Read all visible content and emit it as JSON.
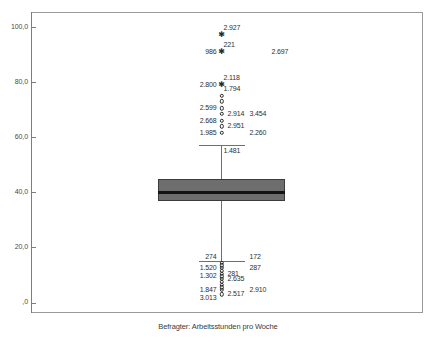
{
  "chart_data": {
    "type": "box",
    "title": "",
    "xlabel": "Befragter: Arbeitsstunden pro Woche",
    "ylabel": "",
    "ylim": [
      0,
      105
    ],
    "grid": false,
    "legend": "none",
    "categories": [
      "Befragter: Arbeitsstunden pro Woche"
    ],
    "y_ticks": [
      {
        "value": 100,
        "label": "100,0"
      },
      {
        "value": 80,
        "label": "80,0"
      },
      {
        "value": 60,
        "label": "60,0"
      },
      {
        "value": 40,
        "label": "40,0"
      },
      {
        "value": 20,
        "label": "20,0"
      },
      {
        "value": 0,
        "label": ",0"
      }
    ],
    "box": {
      "q1": 37.0,
      "median": 40.0,
      "q3": 45.0,
      "whisker_low": 15.0,
      "whisker_high": 57.0
    },
    "outliers": [
      {
        "value": 97.0,
        "marker": "star",
        "labels": [
          {
            "text": "2.927",
            "side": "above"
          }
        ]
      },
      {
        "value": 91.0,
        "marker": "star",
        "labels": [
          {
            "text": "986",
            "side": "left"
          },
          {
            "text": "221",
            "side": "above"
          },
          {
            "text": "2.697",
            "side": "right"
          }
        ]
      },
      {
        "value": 79.0,
        "marker": "star",
        "labels": [
          {
            "text": "2.800",
            "side": "left"
          },
          {
            "text": "2.118",
            "side": "above"
          }
        ]
      },
      {
        "value": 75.0,
        "marker": "circle",
        "labels": [
          {
            "text": "1.794",
            "side": "above"
          }
        ]
      },
      {
        "value": 73.0,
        "marker": "circle",
        "labels": []
      },
      {
        "value": 70.5,
        "marker": "circle",
        "labels": [
          {
            "text": "2.599",
            "side": "left"
          }
        ]
      },
      {
        "value": 68.5,
        "marker": "circle",
        "labels": [
          {
            "text": "2.914",
            "side": "right"
          },
          {
            "text": "3.454",
            "side": "right"
          }
        ]
      },
      {
        "value": 66.0,
        "marker": "circle",
        "labels": [
          {
            "text": "2.668",
            "side": "left"
          }
        ]
      },
      {
        "value": 64.0,
        "marker": "circle",
        "labels": [
          {
            "text": "2.951",
            "side": "right"
          }
        ]
      },
      {
        "value": 61.5,
        "marker": "circle",
        "labels": [
          {
            "text": "1.985",
            "side": "left"
          },
          {
            "text": "2.260",
            "side": "right"
          }
        ]
      },
      {
        "value": 57.0,
        "marker": "none",
        "labels": [
          {
            "text": "1.481",
            "side": "below"
          }
        ]
      },
      {
        "value": 16.5,
        "marker": "none",
        "labels": [
          {
            "text": "274",
            "side": "left"
          },
          {
            "text": "172",
            "side": "right"
          }
        ]
      },
      {
        "value": 14.5,
        "marker": "circle",
        "labels": []
      },
      {
        "value": 13.5,
        "marker": "circle",
        "labels": []
      },
      {
        "value": 12.5,
        "marker": "circle",
        "labels": [
          {
            "text": "1.520",
            "side": "left"
          },
          {
            "text": "287",
            "side": "right"
          }
        ]
      },
      {
        "value": 11.5,
        "marker": "circle",
        "labels": []
      },
      {
        "value": 10.5,
        "marker": "circle",
        "labels": [
          {
            "text": "281",
            "side": "right"
          }
        ]
      },
      {
        "value": 9.5,
        "marker": "circle",
        "labels": [
          {
            "text": "1.302",
            "side": "left"
          }
        ]
      },
      {
        "value": 8.5,
        "marker": "circle",
        "labels": [
          {
            "text": "2.635",
            "side": "right"
          }
        ]
      },
      {
        "value": 7.5,
        "marker": "circle",
        "labels": []
      },
      {
        "value": 6.5,
        "marker": "circle",
        "labels": []
      },
      {
        "value": 5.5,
        "marker": "circle",
        "labels": []
      },
      {
        "value": 4.5,
        "marker": "circle",
        "labels": [
          {
            "text": "1.847",
            "side": "left"
          },
          {
            "text": "2.910",
            "side": "right"
          }
        ]
      },
      {
        "value": 3.0,
        "marker": "circle",
        "labels": [
          {
            "text": "2.517",
            "side": "right"
          }
        ]
      },
      {
        "value": 1.5,
        "marker": "none",
        "labels": [
          {
            "text": "3.013",
            "side": "left"
          }
        ]
      }
    ],
    "colors": {
      "box_fill": "#6e6e6e",
      "box_edge": "#3b3b3b",
      "median": "#141414",
      "whisker": "#6f6f6f",
      "frame": "#9a9a9a",
      "text": "#2f2f2f"
    }
  }
}
